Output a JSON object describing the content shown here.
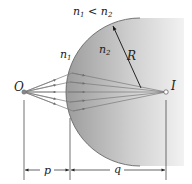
{
  "diagram": {
    "condition_label": {
      "n1": "n",
      "n1_sub": "1",
      "lt": " < ",
      "n2": "n",
      "n2_sub": "2"
    },
    "medium_left": {
      "label": "n",
      "sub": "1"
    },
    "medium_right": {
      "label": "n",
      "sub": "2"
    },
    "radius_label": "R",
    "object_label": "O",
    "image_label": "I",
    "object_distance_label": "p",
    "image_distance_label": "q",
    "colors": {
      "glass_dark": "#9c9c9c",
      "glass_light": "#f4f4f4",
      "ray": "#7a7a7a",
      "arrowhead": "#6f6f6f",
      "line": "#333333"
    }
  }
}
